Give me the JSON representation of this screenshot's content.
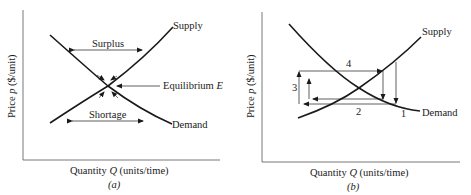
{
  "panel_a": {
    "caption": "(a)",
    "x_axis_label": "Quantity",
    "x_axis_var": "Q",
    "x_axis_units": "(units/time)",
    "y_axis_label": "Price",
    "y_axis_var": "p",
    "y_axis_units": "($/unit)",
    "supply_label": "Supply",
    "demand_label": "Demand",
    "surplus_label": "Surplus",
    "shortage_label": "Shortage",
    "equilibrium_label": "Equilibrium",
    "equilibrium_var": "E"
  },
  "panel_b": {
    "caption": "(b)",
    "x_axis_label": "Quantity",
    "x_axis_var": "Q",
    "x_axis_units": "(units/time)",
    "y_axis_label": "Price",
    "y_axis_var": "p",
    "y_axis_units": "($/unit)",
    "supply_label": "Supply",
    "demand_label": "Demand",
    "step_labels": [
      "1",
      "2",
      "3",
      "4"
    ]
  },
  "colors": {
    "ink": "#1a1a1a",
    "background": "#ffffff"
  }
}
